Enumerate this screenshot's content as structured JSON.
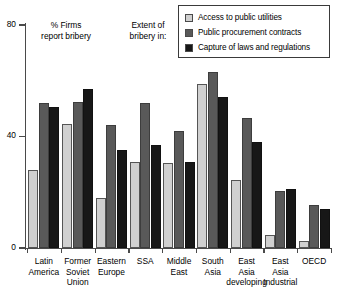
{
  "chart_data": {
    "type": "bar",
    "title": "",
    "subtitle": "",
    "xlabel": "",
    "ylabel": "",
    "ylim": [
      0,
      80
    ],
    "yticks": [
      0,
      40,
      80
    ],
    "ytick_labels": [
      "0",
      "40",
      "80"
    ],
    "grid": false,
    "legend_position": "top-right",
    "categories": [
      "Latin\nAmerica",
      "Former\nSoviet\nUnion",
      "Eastern\nEurope",
      "SSA",
      "Middle\nEast",
      "South\nAsia",
      "East\nAsia\ndeveloping",
      "East\nAsia\nIndustrial",
      "OECD"
    ],
    "series": [
      {
        "name": "Access to public utilities",
        "color": "#d0d0d0",
        "values": [
          28,
          44.5,
          18,
          31,
          30.5,
          59,
          24.5,
          4.5,
          2.5
        ]
      },
      {
        "name": "Public procurement contracts",
        "color": "#595959",
        "values": [
          52,
          52.5,
          44,
          52,
          42,
          63,
          46.5,
          20.5,
          15.5
        ]
      },
      {
        "name": "Capture of laws and regulations",
        "color": "#171717",
        "values": [
          50.5,
          57,
          35,
          37,
          31,
          54,
          38,
          21,
          14
        ]
      }
    ],
    "annotations": [
      {
        "id": "firms",
        "text": "% Firms\nreport bribery"
      },
      {
        "id": "extent",
        "text": "Extent of\nbribery in:"
      }
    ]
  },
  "legend": {
    "items": [
      {
        "label": "Access to public utilities",
        "color": "#d0d0d0"
      },
      {
        "label": "Public procurement contracts",
        "color": "#595959"
      },
      {
        "label": "Capture of laws and regulations",
        "color": "#171717"
      }
    ]
  }
}
